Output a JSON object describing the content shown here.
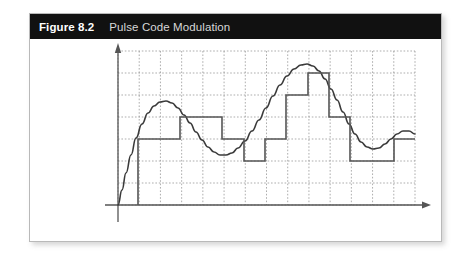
{
  "figure": {
    "label": "Figure 8.2",
    "title": "Pulse Code Modulation",
    "header_bg": "#111111",
    "label_color": "#ffffff",
    "title_color": "#d8d8d8",
    "card_bg": "#ffffff",
    "card_border": "#b9b9b9"
  },
  "chart_data": {
    "type": "line",
    "title": "Pulse Code Modulation",
    "xlabel": "",
    "ylabel": "",
    "grid": true,
    "legend": null,
    "axes": {
      "x_axis_arrow": true,
      "y_axis_arrow": true,
      "x_axis_color": "#555555",
      "y_axis_color": "#555555",
      "origin_px": [
        88,
        191
      ],
      "x_range_px": [
        88,
        385
      ],
      "y_range_px": [
        191,
        37
      ],
      "grid_color": "#8a8a8a",
      "grid_style": "dashed",
      "grid_columns": 14,
      "grid_rows": 7,
      "grid_cell_w": 21.2,
      "grid_cell_h": 22.0
    },
    "series": [
      {
        "name": "analog-signal",
        "type": "smooth-curve",
        "color": "#3a3a3a",
        "width": 1.6,
        "description": "Continuous analog waveform sampled by the PCM staircase",
        "points": [
          [
            88,
            191
          ],
          [
            92,
            176
          ],
          [
            96,
            159
          ],
          [
            101,
            141
          ],
          [
            106,
            124
          ],
          [
            112,
            110
          ],
          [
            118,
            99
          ],
          [
            124,
            92
          ],
          [
            130,
            88
          ],
          [
            136,
            87
          ],
          [
            142,
            89
          ],
          [
            148,
            94
          ],
          [
            154,
            101
          ],
          [
            160,
            109
          ],
          [
            166,
            118
          ],
          [
            172,
            126
          ],
          [
            178,
            133
          ],
          [
            184,
            138
          ],
          [
            190,
            141
          ],
          [
            196,
            141
          ],
          [
            202,
            139
          ],
          [
            208,
            134
          ],
          [
            215,
            127
          ],
          [
            222,
            117
          ],
          [
            229,
            106
          ],
          [
            236,
            94
          ],
          [
            243,
            82
          ],
          [
            250,
            71
          ],
          [
            257,
            62
          ],
          [
            264,
            55
          ],
          [
            271,
            51
          ],
          [
            277,
            50
          ],
          [
            283,
            52
          ],
          [
            289,
            57
          ],
          [
            295,
            65
          ],
          [
            301,
            75
          ],
          [
            307,
            86
          ],
          [
            313,
            98
          ],
          [
            319,
            110
          ],
          [
            325,
            120
          ],
          [
            331,
            128
          ],
          [
            337,
            133
          ],
          [
            343,
            135
          ],
          [
            349,
            134
          ],
          [
            355,
            130
          ],
          [
            361,
            125
          ],
          [
            367,
            120
          ],
          [
            373,
            117
          ],
          [
            379,
            117
          ],
          [
            385,
            120
          ]
        ]
      },
      {
        "name": "pcm-staircase",
        "type": "step",
        "color": "#555555",
        "width": 1.6,
        "description": "Quantized PCM step approximation of the analog signal",
        "steps": [
          {
            "x0": 108,
            "x1": 150,
            "y": 125
          },
          {
            "x0": 150,
            "x1": 192,
            "y": 103
          },
          {
            "x0": 192,
            "x1": 214,
            "y": 125
          },
          {
            "x0": 214,
            "x1": 235,
            "y": 147
          },
          {
            "x0": 235,
            "x1": 256,
            "y": 125
          },
          {
            "x0": 256,
            "x1": 278,
            "y": 81
          },
          {
            "x0": 278,
            "x1": 299,
            "y": 59
          },
          {
            "x0": 299,
            "x1": 320,
            "y": 103
          },
          {
            "x0": 320,
            "x1": 341,
            "y": 147
          },
          {
            "x0": 341,
            "x1": 364,
            "y": 147
          },
          {
            "x0": 364,
            "x1": 385,
            "y": 125
          }
        ],
        "initial_riser": {
          "x": 108,
          "y_from": 191,
          "y_to": 125
        }
      }
    ]
  }
}
